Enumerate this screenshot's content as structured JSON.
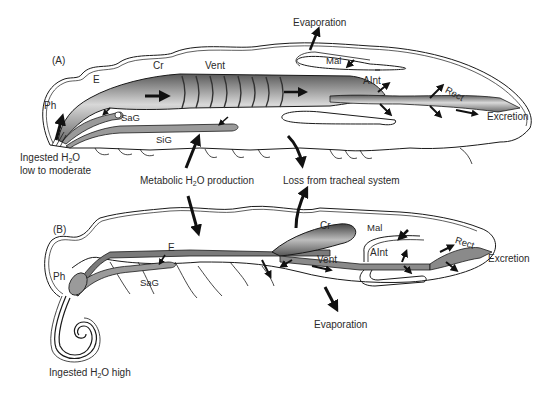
{
  "figure": {
    "panels": [
      {
        "id": "A",
        "letter": "(A)",
        "organ_labels": {
          "ph": "Ph",
          "e": "E",
          "cr": "Cr",
          "vent": "Vent",
          "mal": "Mal",
          "aint": "AInt",
          "rect": "Rect",
          "sag": "SaG",
          "sig": "SiG"
        },
        "flow_labels": {
          "evaporation": "Evaporation",
          "excretion": "Excretion",
          "ingested_prefix": "Ingested H",
          "ingested_sub": "2",
          "ingested_suffix": "O",
          "ingested_line2": "low to moderate"
        }
      },
      {
        "id": "B",
        "letter": "(B)",
        "organ_labels": {
          "ph": "Ph",
          "e": "E",
          "cr": "Cr",
          "vent": "Vent",
          "mal": "Mal",
          "aint": "AInt",
          "rect": "Rect",
          "sag": "SaG"
        },
        "flow_labels": {
          "evaporation": "Evaporation",
          "excretion": "Excretion",
          "ingested_prefix": "Ingested H",
          "ingested_sub": "2",
          "ingested_suffix": "O high"
        }
      }
    ],
    "shared_labels": {
      "metabolic_prefix": "Metabolic H",
      "metabolic_sub": "2",
      "metabolic_suffix": "O production",
      "tracheal_loss": "Loss from tracheal system"
    },
    "colors": {
      "ink": "#1a1a1a",
      "shade": "#8a8a8a",
      "background": "#ffffff"
    }
  }
}
